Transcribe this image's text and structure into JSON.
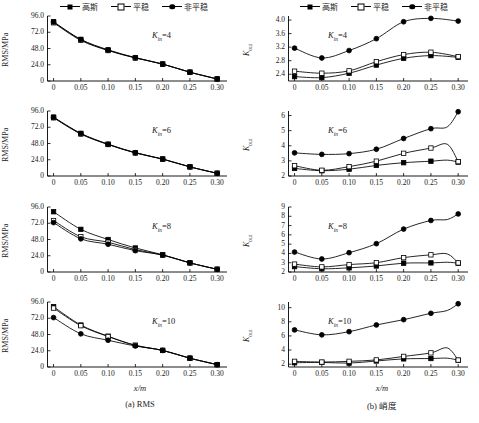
{
  "figure": {
    "caption_a": "(a) RMS",
    "caption_b_prefix": "(b) ",
    "caption_b_cn": "峭度",
    "xlabel": "x/m"
  },
  "legend": {
    "items": [
      {
        "label": "高斯",
        "marker": "filled-square"
      },
      {
        "label": "平稳",
        "marker": "open-square"
      },
      {
        "label": "非平稳",
        "marker": "filled-circle"
      }
    ]
  },
  "axis_labels": {
    "rms": "RMS/MPa",
    "kurtosis_main": "K",
    "kurtosis_sub": "out"
  },
  "annotations": {
    "prefix": "K",
    "sub": "in",
    "values": [
      "=4",
      "=6",
      "=8",
      "=10"
    ]
  },
  "xticks": [
    "0",
    "0.05",
    "0.10",
    "0.15",
    "0.20",
    "0.25",
    "0.30"
  ],
  "chart_data": [
    {
      "id": "rms-kin4",
      "type": "line",
      "title": "",
      "panel": "(a) RMS",
      "annotation": "K_in=4",
      "xlabel": "x/m",
      "ylabel": "RMS/MPa",
      "x": [
        0,
        0.05,
        0.1,
        0.15,
        0.2,
        0.25,
        0.3
      ],
      "xlim": [
        -0.012,
        0.318
      ],
      "ylim": [
        0,
        96
      ],
      "yticks": [
        0,
        24.0,
        48.0,
        72.0,
        96.0
      ],
      "ytick_labels": [
        "0",
        "24.0",
        "48.0",
        "72.0",
        "96.0"
      ],
      "grid": false,
      "legend_position": "top",
      "series": [
        {
          "name": "高斯",
          "marker": "filled-square",
          "values": [
            87.5,
            61.5,
            46.0,
            34.5,
            25.0,
            13.0,
            3.0
          ]
        },
        {
          "name": "平稳",
          "marker": "open-square",
          "values": [
            86.0,
            60.0,
            45.0,
            34.0,
            25.0,
            13.0,
            3.0
          ]
        },
        {
          "name": "非平稳",
          "marker": "filled-circle",
          "values": [
            87.0,
            61.0,
            45.5,
            34.3,
            25.0,
            13.0,
            3.0
          ]
        }
      ]
    },
    {
      "id": "kurt-kin4",
      "type": "line",
      "panel": "(b) 峭度",
      "annotation": "K_in=4",
      "xlabel": "x/m",
      "ylabel": "K_out",
      "x": [
        0,
        0.05,
        0.1,
        0.15,
        0.2,
        0.25,
        0.3
      ],
      "xlim": [
        -0.012,
        0.318
      ],
      "ylim": [
        2.2,
        4.12
      ],
      "yticks": [
        2.4,
        2.8,
        3.2,
        3.6,
        4.0
      ],
      "ytick_labels": [
        "2.4",
        "2.8",
        "3.2",
        "3.6",
        "4.0"
      ],
      "grid": false,
      "legend_position": "top",
      "series": [
        {
          "name": "高斯",
          "marker": "filled-square",
          "values": [
            2.33,
            2.3,
            2.43,
            2.67,
            2.87,
            2.95,
            2.9
          ]
        },
        {
          "name": "平稳",
          "marker": "open-square",
          "values": [
            2.49,
            2.43,
            2.5,
            2.77,
            2.98,
            3.05,
            2.92
          ]
        },
        {
          "name": "非平稳",
          "marker": "filled-circle",
          "values": [
            3.17,
            2.88,
            3.1,
            3.45,
            3.95,
            4.05,
            3.97
          ]
        }
      ]
    },
    {
      "id": "rms-kin6",
      "type": "line",
      "panel": "(a) RMS",
      "annotation": "K_in=6",
      "xlabel": "x/m",
      "ylabel": "RMS/MPa",
      "x": [
        0,
        0.05,
        0.1,
        0.15,
        0.2,
        0.25,
        0.3
      ],
      "xlim": [
        -0.012,
        0.318
      ],
      "ylim": [
        0,
        96
      ],
      "yticks": [
        0,
        24.0,
        48.0,
        72.0,
        96.0
      ],
      "ytick_labels": [
        "0",
        "24.0",
        "48.0",
        "72.0",
        "96.0"
      ],
      "grid": false,
      "legend_position": "none",
      "series": [
        {
          "name": "高斯",
          "marker": "filled-square",
          "values": [
            87.0,
            63.0,
            47.0,
            34.5,
            25.0,
            13.5,
            4.0
          ]
        },
        {
          "name": "平稳",
          "marker": "open-square",
          "values": [
            86.0,
            62.0,
            46.5,
            34.0,
            25.0,
            13.5,
            4.0
          ]
        },
        {
          "name": "非平稳",
          "marker": "filled-circle",
          "values": [
            86.5,
            62.5,
            46.8,
            34.3,
            25.0,
            13.5,
            4.0
          ]
        }
      ]
    },
    {
      "id": "kurt-kin6",
      "type": "line",
      "panel": "(b) 峭度",
      "annotation": "K_in=6",
      "xlabel": "x/m",
      "ylabel": "K_out",
      "x": [
        0,
        0.05,
        0.1,
        0.15,
        0.2,
        0.25,
        0.28,
        0.3
      ],
      "xlim": [
        -0.012,
        0.318
      ],
      "ylim": [
        2,
        6.3
      ],
      "yticks": [
        2,
        3,
        4,
        5,
        6
      ],
      "ytick_labels": [
        "2",
        "3",
        "4",
        "5",
        "6"
      ],
      "grid": false,
      "legend_position": "none",
      "series": [
        {
          "name": "高斯",
          "marker": "filled-square",
          "values": [
            2.5,
            2.35,
            2.45,
            2.7,
            2.88,
            2.98,
            3.05,
            2.92
          ]
        },
        {
          "name": "平稳",
          "marker": "open-square",
          "values": [
            2.68,
            2.38,
            2.62,
            2.98,
            3.5,
            3.85,
            4.1,
            2.95
          ]
        },
        {
          "name": "非平稳",
          "marker": "filled-circle",
          "values": [
            3.53,
            3.43,
            3.48,
            3.77,
            4.48,
            5.13,
            5.25,
            6.25
          ]
        }
      ]
    },
    {
      "id": "rms-kin8",
      "type": "line",
      "panel": "(a) RMS",
      "annotation": "K_in=8",
      "xlabel": "x/m",
      "ylabel": "RMS/MPa",
      "x": [
        0,
        0.05,
        0.1,
        0.15,
        0.2,
        0.25,
        0.3
      ],
      "xlim": [
        -0.012,
        0.318
      ],
      "ylim": [
        0,
        96
      ],
      "yticks": [
        0,
        24.0,
        48.0,
        72.0,
        96.0
      ],
      "ytick_labels": [
        "0",
        "24.0",
        "48.0",
        "72.0",
        "96.0"
      ],
      "grid": false,
      "legend_position": "none",
      "series": [
        {
          "name": "高斯",
          "marker": "filled-square",
          "values": [
            89.0,
            63.0,
            48.0,
            35.5,
            25.5,
            13.5,
            4.0
          ]
        },
        {
          "name": "平稳",
          "marker": "open-square",
          "values": [
            76.0,
            52.0,
            44.0,
            33.0,
            25.0,
            13.5,
            4.0
          ]
        },
        {
          "name": "非平稳",
          "marker": "filled-circle",
          "values": [
            73.0,
            49.0,
            41.0,
            31.5,
            25.0,
            13.5,
            4.0
          ]
        }
      ]
    },
    {
      "id": "kurt-kin8",
      "type": "line",
      "panel": "(b) 峭度",
      "annotation": "K_in=8",
      "xlabel": "x/m",
      "ylabel": "K_out",
      "x": [
        0,
        0.05,
        0.1,
        0.15,
        0.2,
        0.25,
        0.28,
        0.3
      ],
      "xlim": [
        -0.012,
        0.318
      ],
      "ylim": [
        2,
        9
      ],
      "yticks": [
        2,
        3,
        4,
        5,
        6,
        7,
        8,
        9
      ],
      "ytick_labels": [
        "2",
        "3",
        "4",
        "5",
        "6",
        "7",
        "8",
        "9"
      ],
      "grid": false,
      "legend_position": "none",
      "series": [
        {
          "name": "高斯",
          "marker": "filled-square",
          "values": [
            2.58,
            2.35,
            2.45,
            2.65,
            2.95,
            2.98,
            3.05,
            2.95
          ]
        },
        {
          "name": "平稳",
          "marker": "open-square",
          "values": [
            2.85,
            2.55,
            2.8,
            3.0,
            3.55,
            3.85,
            3.95,
            2.98
          ]
        },
        {
          "name": "非平稳",
          "marker": "filled-circle",
          "values": [
            4.15,
            3.4,
            4.08,
            5.05,
            6.62,
            7.55,
            7.65,
            8.25
          ]
        }
      ]
    },
    {
      "id": "rms-kin10",
      "type": "line",
      "panel": "(a) RMS",
      "annotation": "K_in=10",
      "xlabel": "x/m",
      "ylabel": "RMS/MPa",
      "x": [
        0,
        0.05,
        0.1,
        0.15,
        0.2,
        0.25,
        0.3
      ],
      "xlim": [
        -0.012,
        0.318
      ],
      "ylim": [
        0,
        96
      ],
      "yticks": [
        0,
        24.0,
        48.0,
        72.0,
        96.0
      ],
      "ytick_labels": [
        "0",
        "24.0",
        "48.0",
        "72.0",
        "96.0"
      ],
      "grid": false,
      "legend_position": "none",
      "series": [
        {
          "name": "高斯",
          "marker": "filled-square",
          "values": [
            89.0,
            62.0,
            45.5,
            32.0,
            24.5,
            13.0,
            3.5
          ]
        },
        {
          "name": "平稳",
          "marker": "open-square",
          "values": [
            87.0,
            61.0,
            45.0,
            32.0,
            24.5,
            13.0,
            3.5
          ]
        },
        {
          "name": "非平稳",
          "marker": "filled-circle",
          "values": [
            73.0,
            49.0,
            39.5,
            31.0,
            24.5,
            13.0,
            3.5
          ]
        }
      ]
    },
    {
      "id": "kurt-kin10",
      "type": "line",
      "panel": "(b) 峭度",
      "annotation": "K_in=10",
      "xlabel": "x/m",
      "ylabel": "K_out",
      "x": [
        0,
        0.05,
        0.1,
        0.15,
        0.2,
        0.25,
        0.28,
        0.3
      ],
      "xlim": [
        -0.012,
        0.318
      ],
      "ylim": [
        1.6,
        10.8
      ],
      "yticks": [
        2,
        4,
        6,
        8,
        10
      ],
      "ytick_labels": [
        "2",
        "4",
        "6",
        "8",
        "10"
      ],
      "grid": false,
      "legend_position": "none",
      "series": [
        {
          "name": "高斯",
          "marker": "filled-square",
          "values": [
            2.2,
            2.25,
            2.15,
            2.45,
            2.75,
            2.8,
            2.85,
            2.55
          ]
        },
        {
          "name": "平稳",
          "marker": "open-square",
          "values": [
            2.4,
            2.3,
            2.4,
            2.6,
            3.1,
            3.6,
            4.3,
            2.58
          ]
        },
        {
          "name": "非平稳",
          "marker": "filled-circle",
          "values": [
            6.85,
            6.15,
            6.6,
            7.55,
            8.3,
            9.2,
            9.6,
            10.55
          ]
        }
      ]
    }
  ]
}
